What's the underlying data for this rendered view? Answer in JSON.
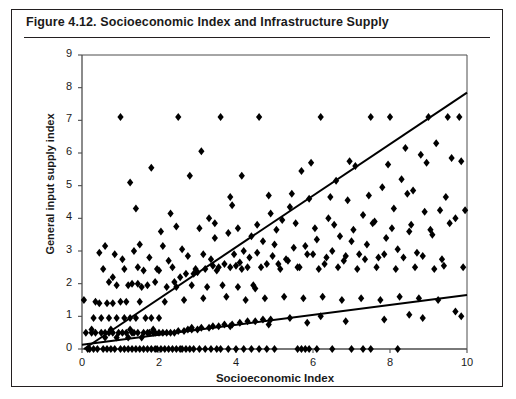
{
  "figure": {
    "number": "Figure 4.12.",
    "title": "Figure 4.12.   Socioeconomic Index and Infrastructure Supply",
    "caption_text": "Socioeconomic Index and Infrastructure Supply"
  },
  "chart_data": {
    "type": "scatter",
    "title": "Socioeconomic Index and Infrastructure Supply",
    "xlabel": "Socioeconomic Index",
    "ylabel": "General input supply index",
    "xlim": [
      0,
      10
    ],
    "ylim": [
      0,
      9
    ],
    "xticks": [
      0,
      2,
      4,
      6,
      8,
      10
    ],
    "xtick_labels": [
      "0",
      "2",
      "4",
      "6",
      "8",
      "10"
    ],
    "yticks": [
      0,
      1,
      2,
      3,
      4,
      5,
      6,
      7,
      8,
      9
    ],
    "ytick_labels": [
      "0",
      "1",
      "2",
      "3",
      "4",
      "5",
      "6",
      "7",
      "8",
      "9"
    ],
    "grid": false,
    "legend": null,
    "marker": "diamond",
    "marker_color": "#000000",
    "marker_size": 4,
    "axis_color": "#4d4d4d",
    "line_color": "#000000",
    "trend_lines": [
      {
        "name": "steep-regression-line",
        "x": [
          0.05,
          10.0
        ],
        "y": [
          0.0,
          7.85
        ],
        "slope": 0.79,
        "intercept": -0.04
      },
      {
        "name": "shallow-regression-line",
        "x": [
          0.0,
          10.0
        ],
        "y": [
          0.13,
          1.65
        ],
        "slope": 0.152,
        "intercept": 0.13
      }
    ],
    "points": [
      [
        0.05,
        1.5
      ],
      [
        0.1,
        0.5
      ],
      [
        0.15,
        0.0
      ],
      [
        0.2,
        0.0
      ],
      [
        0.25,
        0.5
      ],
      [
        0.3,
        0.95
      ],
      [
        0.3,
        0.0
      ],
      [
        0.35,
        0.5
      ],
      [
        0.4,
        0.0
      ],
      [
        0.45,
        1.4
      ],
      [
        0.5,
        0.95
      ],
      [
        0.5,
        0.5
      ],
      [
        0.55,
        0.0
      ],
      [
        0.6,
        0.5
      ],
      [
        0.6,
        0.35
      ],
      [
        0.65,
        0.0
      ],
      [
        0.7,
        0.95
      ],
      [
        0.7,
        0.5
      ],
      [
        0.75,
        0.0
      ],
      [
        0.8,
        0.5
      ],
      [
        0.8,
        1.4
      ],
      [
        0.85,
        0.0
      ],
      [
        0.9,
        0.95
      ],
      [
        0.9,
        0.35
      ],
      [
        0.95,
        0.5
      ],
      [
        1.0,
        0.0
      ],
      [
        1.0,
        1.45
      ],
      [
        1.05,
        0.5
      ],
      [
        1.1,
        0.0
      ],
      [
        1.1,
        0.95
      ],
      [
        1.15,
        0.5
      ],
      [
        1.2,
        0.35
      ],
      [
        1.2,
        0.0
      ],
      [
        1.25,
        0.95
      ],
      [
        1.3,
        0.5
      ],
      [
        1.3,
        0.0
      ],
      [
        1.35,
        0.5
      ],
      [
        1.4,
        0.0
      ],
      [
        1.4,
        0.95
      ],
      [
        1.45,
        0.5
      ],
      [
        1.5,
        0.0
      ],
      [
        1.5,
        1.45
      ],
      [
        1.55,
        0.35
      ],
      [
        1.6,
        0.5
      ],
      [
        1.6,
        0.0
      ],
      [
        1.65,
        0.95
      ],
      [
        1.7,
        0.5
      ],
      [
        1.7,
        0.0
      ],
      [
        1.75,
        0.5
      ],
      [
        1.8,
        0.0
      ],
      [
        1.8,
        0.95
      ],
      [
        1.85,
        0.5
      ],
      [
        1.9,
        0.0
      ],
      [
        1.9,
        0.5
      ],
      [
        1.95,
        0.0
      ],
      [
        2.0,
        0.95
      ],
      [
        2.0,
        0.5
      ],
      [
        2.05,
        0.0
      ],
      [
        2.1,
        0.5
      ],
      [
        2.15,
        0.0
      ],
      [
        2.2,
        0.5
      ],
      [
        2.25,
        0.0
      ],
      [
        2.3,
        0.5
      ],
      [
        2.35,
        0.0
      ],
      [
        2.4,
        0.5
      ],
      [
        2.45,
        0.0
      ],
      [
        2.5,
        0.55
      ],
      [
        2.55,
        0.0
      ],
      [
        2.6,
        0.0
      ],
      [
        2.65,
        0.55
      ],
      [
        2.7,
        0.0
      ],
      [
        2.75,
        0.6
      ],
      [
        2.8,
        0.0
      ],
      [
        2.85,
        0.6
      ],
      [
        2.9,
        0.0
      ],
      [
        3.0,
        0.6
      ],
      [
        3.05,
        0.0
      ],
      [
        3.1,
        0.65
      ],
      [
        3.2,
        0.0
      ],
      [
        3.3,
        0.65
      ],
      [
        3.35,
        0.0
      ],
      [
        3.4,
        0.7
      ],
      [
        3.5,
        0.0
      ],
      [
        3.55,
        0.7
      ],
      [
        3.6,
        0.0
      ],
      [
        3.7,
        0.75
      ],
      [
        3.8,
        0.0
      ],
      [
        3.9,
        0.75
      ],
      [
        4.0,
        0.0
      ],
      [
        4.1,
        0.8
      ],
      [
        4.2,
        0.0
      ],
      [
        4.3,
        0.85
      ],
      [
        4.4,
        0.0
      ],
      [
        4.5,
        0.85
      ],
      [
        4.6,
        0.0
      ],
      [
        4.7,
        0.9
      ],
      [
        4.8,
        0.0
      ],
      [
        4.9,
        0.9
      ],
      [
        5.0,
        0.0
      ],
      [
        5.4,
        0.95
      ],
      [
        5.6,
        0.0
      ],
      [
        5.7,
        0.0
      ],
      [
        5.8,
        0.0
      ],
      [
        5.9,
        0.0
      ],
      [
        6.1,
        0.0
      ],
      [
        6.2,
        1.0
      ],
      [
        6.5,
        0.0
      ],
      [
        7.0,
        0.0
      ],
      [
        7.3,
        0.0
      ],
      [
        7.5,
        0.0
      ],
      [
        8.2,
        0.0
      ],
      [
        8.5,
        1.05
      ],
      [
        0.6,
        3.15
      ],
      [
        0.7,
        2.05
      ],
      [
        0.8,
        2.2
      ],
      [
        0.9,
        1.95
      ],
      [
        1.0,
        7.1
      ],
      [
        1.1,
        2.45
      ],
      [
        1.2,
        1.95
      ],
      [
        1.25,
        5.1
      ],
      [
        1.3,
        2.0
      ],
      [
        1.4,
        4.3
      ],
      [
        1.45,
        2.0
      ],
      [
        1.5,
        3.2
      ],
      [
        1.6,
        2.4
      ],
      [
        1.7,
        1.95
      ],
      [
        1.8,
        5.55
      ],
      [
        1.9,
        2.05
      ],
      [
        2.0,
        2.4
      ],
      [
        2.1,
        3.15
      ],
      [
        2.2,
        1.9
      ],
      [
        2.3,
        4.15
      ],
      [
        2.4,
        2.05
      ],
      [
        2.5,
        7.1
      ],
      [
        2.55,
        2.2
      ],
      [
        2.6,
        3.05
      ],
      [
        2.7,
        2.3
      ],
      [
        2.8,
        5.3
      ],
      [
        2.9,
        2.3
      ],
      [
        3.0,
        2.35
      ],
      [
        3.1,
        6.05
      ],
      [
        3.15,
        2.9
      ],
      [
        3.2,
        2.45
      ],
      [
        3.3,
        4.0
      ],
      [
        3.4,
        2.55
      ],
      [
        3.45,
        3.4
      ],
      [
        3.5,
        2.4
      ],
      [
        3.6,
        7.1
      ],
      [
        3.7,
        2.6
      ],
      [
        3.8,
        3.55
      ],
      [
        3.85,
        2.5
      ],
      [
        3.9,
        4.4
      ],
      [
        4.0,
        2.55
      ],
      [
        4.1,
        2.65
      ],
      [
        4.15,
        5.3
      ],
      [
        4.2,
        3.0
      ],
      [
        4.3,
        2.5
      ],
      [
        4.4,
        3.45
      ],
      [
        4.5,
        1.85
      ],
      [
        4.55,
        2.95
      ],
      [
        4.6,
        7.1
      ],
      [
        4.7,
        3.3
      ],
      [
        4.8,
        2.6
      ],
      [
        4.9,
        4.15
      ],
      [
        5.0,
        3.2
      ],
      [
        5.1,
        2.6
      ],
      [
        5.2,
        3.95
      ],
      [
        5.3,
        2.75
      ],
      [
        5.4,
        4.35
      ],
      [
        5.5,
        3.1
      ],
      [
        5.6,
        2.5
      ],
      [
        5.7,
        5.45
      ],
      [
        5.8,
        3.15
      ],
      [
        5.9,
        4.6
      ],
      [
        6.0,
        2.9
      ],
      [
        6.1,
        3.35
      ],
      [
        6.2,
        7.1
      ],
      [
        6.3,
        2.6
      ],
      [
        6.4,
        4.0
      ],
      [
        6.5,
        3.0
      ],
      [
        6.6,
        5.15
      ],
      [
        6.7,
        3.45
      ],
      [
        6.8,
        2.7
      ],
      [
        6.9,
        4.55
      ],
      [
        7.0,
        3.3
      ],
      [
        7.1,
        5.6
      ],
      [
        7.2,
        2.9
      ],
      [
        7.3,
        4.1
      ],
      [
        7.4,
        3.2
      ],
      [
        7.5,
        7.1
      ],
      [
        7.6,
        3.9
      ],
      [
        7.7,
        2.8
      ],
      [
        7.8,
        4.95
      ],
      [
        7.9,
        3.4
      ],
      [
        8.0,
        7.1
      ],
      [
        8.1,
        4.3
      ],
      [
        8.2,
        3.05
      ],
      [
        8.3,
        5.2
      ],
      [
        8.4,
        6.15
      ],
      [
        8.5,
        3.6
      ],
      [
        8.6,
        4.85
      ],
      [
        8.7,
        2.95
      ],
      [
        8.8,
        5.95
      ],
      [
        8.9,
        4.2
      ],
      [
        9.0,
        7.1
      ],
      [
        9.1,
        3.5
      ],
      [
        9.2,
        6.3
      ],
      [
        9.3,
        4.25
      ],
      [
        9.4,
        2.55
      ],
      [
        9.5,
        7.1
      ],
      [
        9.6,
        5.85
      ],
      [
        9.7,
        4.0
      ],
      [
        9.8,
        7.1
      ],
      [
        9.9,
        2.5
      ],
      [
        9.95,
        4.25
      ],
      [
        0.35,
        1.45
      ],
      [
        0.65,
        1.4
      ],
      [
        1.15,
        1.45
      ],
      [
        1.55,
        1.9
      ],
      [
        2.45,
        1.9
      ],
      [
        2.85,
        1.95
      ],
      [
        3.25,
        1.9
      ],
      [
        3.65,
        1.95
      ],
      [
        4.05,
        1.9
      ],
      [
        4.45,
        1.95
      ],
      [
        0.45,
        2.95
      ],
      [
        0.85,
        2.9
      ],
      [
        1.35,
        3.0
      ],
      [
        2.15,
        1.45
      ],
      [
        2.65,
        1.5
      ],
      [
        3.15,
        1.55
      ],
      [
        3.75,
        1.6
      ],
      [
        4.25,
        1.5
      ],
      [
        4.75,
        1.55
      ],
      [
        5.25,
        1.6
      ],
      [
        5.75,
        1.55
      ],
      [
        6.25,
        1.6
      ],
      [
        6.75,
        1.5
      ],
      [
        7.25,
        1.55
      ],
      [
        7.75,
        1.5
      ],
      [
        8.25,
        1.6
      ],
      [
        8.75,
        1.55
      ],
      [
        9.25,
        1.5
      ],
      [
        9.7,
        1.15
      ],
      [
        1.05,
        2.75
      ],
      [
        1.75,
        2.8
      ],
      [
        2.25,
        2.7
      ],
      [
        2.75,
        2.85
      ],
      [
        3.35,
        2.75
      ],
      [
        3.95,
        2.9
      ],
      [
        4.35,
        2.8
      ],
      [
        4.95,
        2.85
      ],
      [
        5.35,
        2.7
      ],
      [
        5.85,
        2.9
      ],
      [
        6.35,
        2.8
      ],
      [
        6.85,
        2.85
      ],
      [
        7.35,
        2.75
      ],
      [
        7.85,
        2.9
      ],
      [
        8.35,
        2.8
      ],
      [
        8.85,
        2.85
      ],
      [
        9.35,
        2.75
      ],
      [
        0.55,
        2.45
      ],
      [
        1.45,
        2.5
      ],
      [
        1.95,
        2.45
      ],
      [
        2.35,
        2.5
      ],
      [
        2.95,
        2.45
      ],
      [
        3.55,
        2.5
      ],
      [
        4.15,
        2.45
      ],
      [
        4.65,
        2.5
      ],
      [
        5.15,
        2.45
      ],
      [
        5.65,
        2.5
      ],
      [
        6.15,
        2.45
      ],
      [
        6.65,
        2.5
      ],
      [
        7.15,
        2.45
      ],
      [
        7.65,
        2.5
      ],
      [
        8.15,
        2.45
      ],
      [
        8.65,
        2.5
      ],
      [
        9.15,
        2.45
      ],
      [
        2.05,
        3.6
      ],
      [
        2.45,
        3.75
      ],
      [
        3.05,
        3.7
      ],
      [
        3.45,
        3.85
      ],
      [
        4.05,
        3.7
      ],
      [
        4.55,
        3.8
      ],
      [
        5.05,
        3.65
      ],
      [
        5.55,
        3.85
      ],
      [
        6.05,
        3.7
      ],
      [
        6.55,
        3.8
      ],
      [
        7.05,
        3.65
      ],
      [
        7.55,
        3.85
      ],
      [
        8.05,
        3.7
      ],
      [
        8.55,
        3.8
      ],
      [
        9.05,
        3.65
      ],
      [
        9.55,
        3.85
      ],
      [
        3.85,
        4.65
      ],
      [
        4.85,
        4.7
      ],
      [
        5.45,
        4.75
      ],
      [
        6.45,
        4.65
      ],
      [
        7.45,
        4.7
      ],
      [
        8.45,
        4.75
      ],
      [
        9.45,
        4.65
      ],
      [
        5.95,
        5.7
      ],
      [
        6.95,
        5.75
      ],
      [
        7.95,
        5.65
      ],
      [
        8.95,
        5.7
      ],
      [
        9.85,
        5.75
      ],
      [
        0.25,
        0.6
      ],
      [
        0.75,
        0.6
      ],
      [
        1.25,
        0.6
      ],
      [
        1.85,
        0.6
      ],
      [
        2.85,
        0.65
      ],
      [
        3.85,
        0.7
      ],
      [
        4.85,
        0.75
      ],
      [
        5.85,
        0.8
      ],
      [
        6.85,
        0.85
      ],
      [
        7.85,
        0.9
      ],
      [
        8.85,
        0.95
      ],
      [
        9.85,
        1.0
      ]
    ]
  }
}
